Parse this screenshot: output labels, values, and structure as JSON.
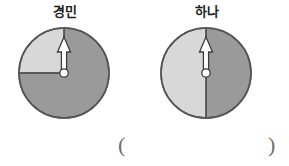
{
  "page": {
    "background_color": "#ffffff",
    "width": 289,
    "height": 166
  },
  "colors": {
    "light_sector": "#d8d8d8",
    "dark_sector": "#9a9a9a",
    "outline": "#555555",
    "arrow_fill": "#ffffff",
    "arrow_outline": "#3d3d3d",
    "pivot_fill": "#ffffff",
    "label_text": "#1d1d1d",
    "paren_text": "#6e6e6e"
  },
  "spinners": [
    {
      "id": "spinner-1",
      "label": "경민",
      "center_x": 64,
      "center_y": 73,
      "radius": 45,
      "pointer_direction": "up",
      "sectors": [
        {
          "name": "light-sector",
          "fraction": "1/4",
          "color": "#d8d8d8",
          "position": "upper-left"
        },
        {
          "name": "dark-sector",
          "fraction": "3/4",
          "color": "#9a9a9a",
          "position": "remaining"
        }
      ],
      "divider_lines": [
        "center-to-top",
        "center-to-left"
      ]
    },
    {
      "id": "spinner-2",
      "label": "하나",
      "center_x": 206,
      "center_y": 73,
      "radius": 45,
      "pointer_direction": "up",
      "sectors": [
        {
          "name": "light-sector",
          "fraction": "1/2",
          "color": "#d8d8d8",
          "position": "left-half"
        },
        {
          "name": "dark-sector",
          "fraction": "1/2",
          "color": "#9a9a9a",
          "position": "right-half"
        }
      ],
      "divider_lines": [
        "vertical-diameter"
      ]
    }
  ],
  "answer": {
    "paren_open": "(",
    "paren_close": ")",
    "value": ""
  }
}
